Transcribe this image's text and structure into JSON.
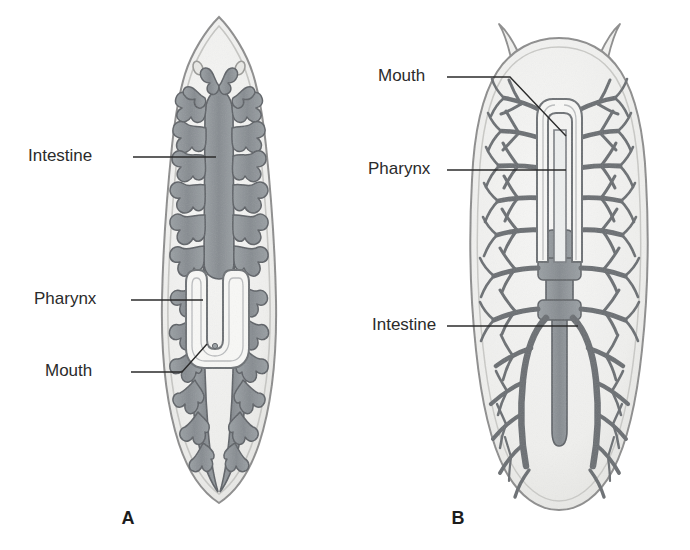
{
  "figure": {
    "background_color": "#ffffff",
    "panels": [
      {
        "id": "A",
        "letter": "A",
        "organism": "planarian-triclad",
        "letter_position": {
          "x": 128,
          "y": 519
        },
        "labels": [
          {
            "name": "intestine",
            "text": "Intestine",
            "text_x": 28,
            "text_y": 157,
            "leader": "M133,157 L216,157"
          },
          {
            "name": "pharynx",
            "text": "Pharynx",
            "text_x": 34,
            "text_y": 300,
            "leader": "M131,300 L203,300"
          },
          {
            "name": "mouth",
            "text": "Mouth",
            "text_x": 45,
            "text_y": 372,
            "leader": "M131,372 L182,372 L207,344"
          }
        ]
      },
      {
        "id": "B",
        "letter": "B",
        "organism": "polyclad-flatworm",
        "letter_position": {
          "x": 458,
          "y": 519
        },
        "labels": [
          {
            "name": "mouth",
            "text": "Mouth",
            "text_x": 378,
            "text_y": 77,
            "leader": "M447,77 L510,77 L566,136"
          },
          {
            "name": "pharynx",
            "text": "Pharynx",
            "text_x": 368,
            "text_y": 170,
            "leader": "M447,170 L566,170"
          },
          {
            "name": "intestine",
            "text": "Intestine",
            "text_x": 372,
            "text_y": 326,
            "leader": "M447,326 L578,326"
          }
        ]
      }
    ]
  },
  "colors": {
    "body_fill": "#f1f1ef",
    "body_outline": "#8d8d8d",
    "gut_fill": "#8d9195",
    "gut_outline": "#5d6166",
    "pharynx_fill": "#f7f7f5",
    "pharynx_outline": "#6d7175",
    "label_text": "#2b2b2b",
    "leader_line": "#2b2b2b"
  }
}
